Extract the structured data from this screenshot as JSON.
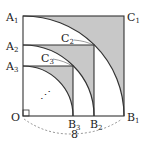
{
  "diagram": {
    "colors": {
      "shade": "#c8c8c8",
      "line": "#333333",
      "background": "#ffffff"
    },
    "points": {
      "O": {
        "label": "O",
        "sub": ""
      },
      "A1": {
        "label": "A",
        "sub": "1"
      },
      "A2": {
        "label": "A",
        "sub": "2"
      },
      "A3": {
        "label": "A",
        "sub": "3"
      },
      "B1": {
        "label": "B",
        "sub": "1"
      },
      "B2": {
        "label": "B",
        "sub": "2"
      },
      "B3": {
        "label": "B",
        "sub": "3"
      },
      "C1": {
        "label": "C",
        "sub": "1"
      },
      "C2": {
        "label": "C",
        "sub": "2"
      },
      "C3": {
        "label": "C",
        "sub": "3"
      }
    },
    "length_label": "8",
    "continuation": "⋰"
  }
}
